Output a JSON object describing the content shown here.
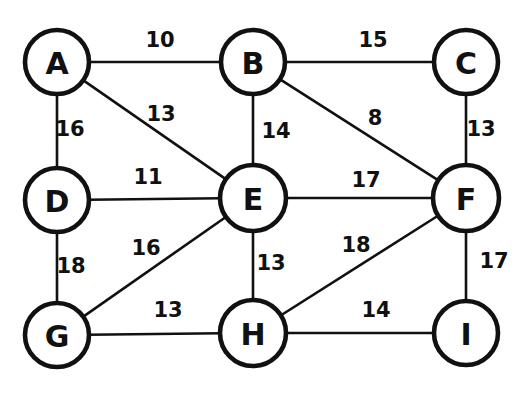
{
  "figure": {
    "type": "undirected-weighted-graph",
    "width": 522,
    "height": 395,
    "background_color": "#ffffff",
    "stroke_color": "#111111"
  },
  "chart_data": {
    "type": "diagram",
    "title": "",
    "graph_kind": "undirected weighted graph",
    "node_count": 9,
    "edge_count": 16,
    "nodes": [
      {
        "id": "A",
        "label": "A",
        "x": 57,
        "y": 62,
        "r": 32
      },
      {
        "id": "B",
        "label": "B",
        "x": 253,
        "y": 62,
        "r": 32
      },
      {
        "id": "C",
        "label": "C",
        "x": 466,
        "y": 62,
        "r": 32
      },
      {
        "id": "D",
        "label": "D",
        "x": 57,
        "y": 200,
        "r": 32
      },
      {
        "id": "E",
        "label": "E",
        "x": 253,
        "y": 198,
        "r": 33
      },
      {
        "id": "F",
        "label": "F",
        "x": 466,
        "y": 198,
        "r": 33
      },
      {
        "id": "G",
        "label": "G",
        "x": 57,
        "y": 335,
        "r": 32
      },
      {
        "id": "H",
        "label": "H",
        "x": 253,
        "y": 333,
        "r": 33
      },
      {
        "id": "I",
        "label": "I",
        "x": 466,
        "y": 333,
        "r": 32
      }
    ],
    "edges": [
      {
        "from": "A",
        "to": "B",
        "weight": 10,
        "label": "10",
        "lx": 160,
        "ly": 40
      },
      {
        "from": "B",
        "to": "C",
        "weight": 15,
        "label": "15",
        "lx": 373,
        "ly": 40
      },
      {
        "from": "A",
        "to": "D",
        "weight": 16,
        "label": "16",
        "lx": 70,
        "ly": 129
      },
      {
        "from": "A",
        "to": "E",
        "weight": 13,
        "label": "13",
        "lx": 161,
        "ly": 114
      },
      {
        "from": "B",
        "to": "E",
        "weight": 14,
        "label": "14",
        "lx": 276,
        "ly": 131
      },
      {
        "from": "B",
        "to": "F",
        "weight": 8,
        "label": "8",
        "lx": 375,
        "ly": 118
      },
      {
        "from": "C",
        "to": "F",
        "weight": 13,
        "label": "13",
        "lx": 481,
        "ly": 129
      },
      {
        "from": "D",
        "to": "E",
        "weight": 11,
        "label": "11",
        "lx": 148,
        "ly": 177
      },
      {
        "from": "E",
        "to": "F",
        "weight": 17,
        "label": "17",
        "lx": 366,
        "ly": 180
      },
      {
        "from": "D",
        "to": "G",
        "weight": 18,
        "label": "18",
        "lx": 71,
        "ly": 266
      },
      {
        "from": "E",
        "to": "G",
        "weight": 16,
        "label": "16",
        "lx": 146,
        "ly": 248
      },
      {
        "from": "E",
        "to": "H",
        "weight": 13,
        "label": "13",
        "lx": 271,
        "ly": 263
      },
      {
        "from": "F",
        "to": "H",
        "weight": 18,
        "label": "18",
        "lx": 356,
        "ly": 245
      },
      {
        "from": "F",
        "to": "I",
        "weight": 17,
        "label": "17",
        "lx": 494,
        "ly": 261
      },
      {
        "from": "G",
        "to": "H",
        "weight": 13,
        "label": "13",
        "lx": 168,
        "ly": 310
      },
      {
        "from": "H",
        "to": "I",
        "weight": 14,
        "label": "14",
        "lx": 376,
        "ly": 310
      }
    ],
    "adjacency_summary": {
      "A": [
        "B",
        "D",
        "E"
      ],
      "B": [
        "A",
        "C",
        "E",
        "F"
      ],
      "C": [
        "B",
        "F"
      ],
      "D": [
        "A",
        "E",
        "G"
      ],
      "E": [
        "A",
        "B",
        "D",
        "F",
        "G",
        "H"
      ],
      "F": [
        "B",
        "C",
        "E",
        "H",
        "I"
      ],
      "G": [
        "D",
        "E",
        "H"
      ],
      "H": [
        "E",
        "F",
        "G",
        "I"
      ],
      "I": [
        "F",
        "H"
      ]
    }
  }
}
